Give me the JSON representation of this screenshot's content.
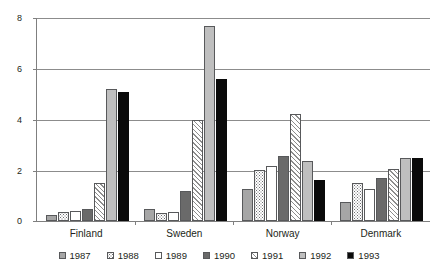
{
  "chart_data": {
    "type": "bar",
    "title": "",
    "subtitle": "",
    "xlabel": "",
    "ylabel": "",
    "ylim": [
      0,
      8
    ],
    "yticks": [
      0,
      2,
      4,
      6,
      8
    ],
    "grid": true,
    "legend_position": "bottom",
    "categories": [
      "Finland",
      "Sweden",
      "Norway",
      "Denmark"
    ],
    "series": [
      {
        "name": "1987",
        "pattern": "solid-medium-gray",
        "color": "#a6a6a6",
        "values": [
          0.22,
          0.48,
          1.25,
          0.75
        ]
      },
      {
        "name": "1988",
        "pattern": "dotted",
        "color": "#ffffff",
        "values": [
          0.35,
          0.3,
          2.0,
          1.5
        ]
      },
      {
        "name": "1989",
        "pattern": "empty-white",
        "color": "#ffffff",
        "values": [
          0.4,
          0.35,
          2.15,
          1.25
        ]
      },
      {
        "name": "1990",
        "pattern": "solid-dark-gray",
        "color": "#6a6a6a",
        "values": [
          0.48,
          1.2,
          2.55,
          1.7
        ]
      },
      {
        "name": "1991",
        "pattern": "diagonal-hatch",
        "color": "#ffffff",
        "values": [
          1.48,
          4.0,
          4.22,
          2.05
        ]
      },
      {
        "name": "1992",
        "pattern": "solid-light-gray",
        "color": "#bfbfbf",
        "values": [
          5.2,
          7.7,
          2.35,
          2.5
        ]
      },
      {
        "name": "1993",
        "pattern": "solid-black",
        "color": "#0a0a0a",
        "values": [
          5.1,
          5.6,
          1.6,
          2.5
        ]
      }
    ]
  }
}
